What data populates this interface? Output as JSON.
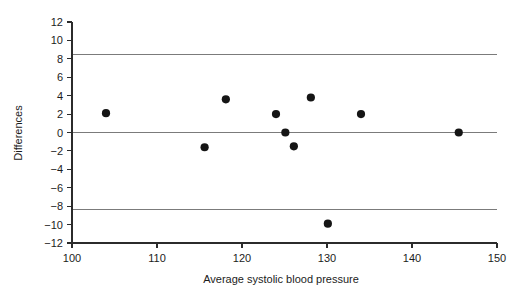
{
  "chart_data": {
    "type": "scatter",
    "title": "",
    "xlabel": "Average systolic blood pressure",
    "ylabel": "Differences",
    "xlim": [
      100,
      150
    ],
    "ylim": [
      -12,
      12
    ],
    "xticks": [
      100,
      110,
      120,
      130,
      140,
      150
    ],
    "yticks": [
      12,
      10,
      8,
      6,
      4,
      2,
      0,
      -2,
      -4,
      -6,
      -8,
      -10,
      -12
    ],
    "xtick_labels": [
      "100",
      "110",
      "120",
      "130",
      "140",
      "150"
    ],
    "ytick_labels": [
      "12",
      "10",
      "8",
      "6",
      "4",
      "2",
      "0",
      "-2",
      "-4",
      "-6",
      "-8",
      "-10",
      "-12"
    ],
    "grid": false,
    "legend": null,
    "point_color": "#151515",
    "reference_line_color": "#7b7b7b",
    "axis_color": "#2b2b2b",
    "reference_lines": [
      {
        "name": "upper-limit-of-agreement",
        "y": 8.5
      },
      {
        "name": "mean-difference",
        "y": 0.0
      },
      {
        "name": "lower-limit-of-agreement",
        "y": -8.4
      }
    ],
    "points": [
      {
        "x": 104.0,
        "y": 2.1
      },
      {
        "x": 115.6,
        "y": -1.6
      },
      {
        "x": 118.1,
        "y": 3.6
      },
      {
        "x": 124.0,
        "y": 2.0
      },
      {
        "x": 125.1,
        "y": 0.0
      },
      {
        "x": 126.1,
        "y": -1.5
      },
      {
        "x": 128.1,
        "y": 3.8
      },
      {
        "x": 130.1,
        "y": -9.9
      },
      {
        "x": 134.0,
        "y": 2.0
      },
      {
        "x": 145.5,
        "y": 0.0
      }
    ]
  }
}
